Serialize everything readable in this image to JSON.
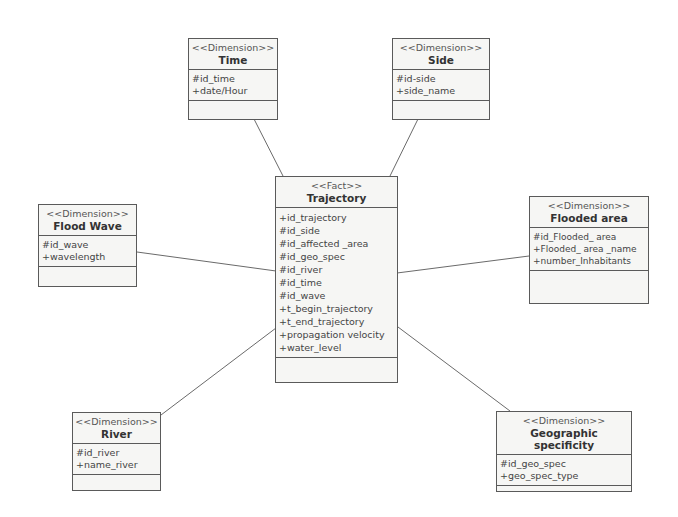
{
  "diagram": {
    "type": "UML star schema (fact / dimension classes)",
    "line_color": "#6a6a6a",
    "box_border_color": "#5a5a5a",
    "box_fill_color": "#f6f6f4"
  },
  "classes": {
    "time": {
      "stereotype": "<<Dimension>>",
      "name": "Time",
      "attributes": [
        "#id_time",
        "+date/Hour"
      ]
    },
    "side": {
      "stereotype": "<<Dimension>>",
      "name": "Side",
      "attributes": [
        "#id-side",
        "+side_name"
      ]
    },
    "trajectory": {
      "stereotype": "<<Fact>>",
      "name": "Trajectory",
      "attributes": [
        "+id_trajectory",
        "#id_side",
        "#id_affected _area",
        "#id_geo_spec",
        "#id_river",
        "#id_time",
        "#id_wave",
        "+t_begin_trajectory",
        "+t_end_trajectory",
        "+propagation velocity",
        "+water_level"
      ]
    },
    "flood_wave": {
      "stereotype": "<<Dimension>>",
      "name": "Flood Wave",
      "attributes": [
        "#id_wave",
        "+wavelength"
      ]
    },
    "flooded_area": {
      "stereotype": "<<Dimension>>",
      "name": "Flooded area",
      "attributes": [
        "#id_Flooded_ area",
        "+Flooded_ area _name",
        "+number_Inhabitants"
      ]
    },
    "river": {
      "stereotype": "<<Dimension>>",
      "name": "River",
      "attributes": [
        "#id_river",
        "+name_river"
      ]
    },
    "geo_spec": {
      "stereotype": "<<Dimension>>",
      "name": "Geographic specificity",
      "attributes": [
        "#id_geo_spec",
        "+geo_spec_type"
      ]
    }
  },
  "associations": [
    {
      "from": "Trajectory",
      "to": "Time"
    },
    {
      "from": "Trajectory",
      "to": "Side"
    },
    {
      "from": "Trajectory",
      "to": "Flood Wave"
    },
    {
      "from": "Trajectory",
      "to": "Flooded area"
    },
    {
      "from": "Trajectory",
      "to": "River"
    },
    {
      "from": "Trajectory",
      "to": "Geographic specificity"
    }
  ]
}
